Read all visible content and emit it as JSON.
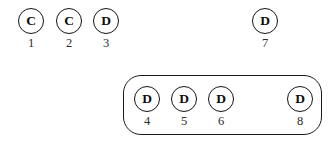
{
  "diagram": {
    "canvas": {
      "width": 334,
      "height": 142,
      "background": "#ffffff"
    },
    "style": {
      "node_stroke": "#151515",
      "node_fill": "#ffffff",
      "group_stroke": "#1a1a1a",
      "label_color": "#2b2b2b",
      "letter_color": "#0d0d0d"
    },
    "nodes": [
      {
        "id": "node-1",
        "letter": "C",
        "label": "1",
        "x": 31,
        "y": 21,
        "grouped": false
      },
      {
        "id": "node-2",
        "letter": "C",
        "label": "2",
        "x": 69,
        "y": 21,
        "grouped": false
      },
      {
        "id": "node-3",
        "letter": "D",
        "label": "3",
        "x": 106,
        "y": 21,
        "grouped": false
      },
      {
        "id": "node-7",
        "letter": "D",
        "label": "7",
        "x": 265,
        "y": 21,
        "grouped": false
      },
      {
        "id": "node-4",
        "letter": "D",
        "label": "4",
        "x": 147,
        "y": 99,
        "grouped": true
      },
      {
        "id": "node-5",
        "letter": "D",
        "label": "5",
        "x": 184,
        "y": 99,
        "grouped": true
      },
      {
        "id": "node-6",
        "letter": "D",
        "label": "6",
        "x": 221,
        "y": 99,
        "grouped": true
      },
      {
        "id": "node-8",
        "letter": "D",
        "label": "8",
        "x": 300,
        "y": 99,
        "grouped": true
      }
    ],
    "groups": [
      {
        "id": "group-box-1",
        "members": [
          "node-4",
          "node-5",
          "node-6",
          "node-8"
        ],
        "x": 123,
        "y": 75,
        "width": 199,
        "height": 60,
        "corner_radius": 18
      }
    ]
  }
}
